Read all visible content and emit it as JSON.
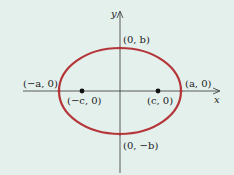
{
  "diagram": {
    "type": "ellipse-with-foci",
    "axes": {
      "x_label": "x",
      "y_label": "y"
    },
    "colors": {
      "background": "#e4f0ec",
      "ellipse": "#b5363a",
      "axes": "#333333",
      "points": "#111111"
    },
    "labels": {
      "top_vertex": "(0, b)",
      "bottom_vertex": "(0, −b)",
      "left_vertex": "(−a, 0)",
      "right_vertex": "(a, 0)",
      "left_focus": "(−c, 0)",
      "right_focus": "(c, 0)"
    }
  }
}
